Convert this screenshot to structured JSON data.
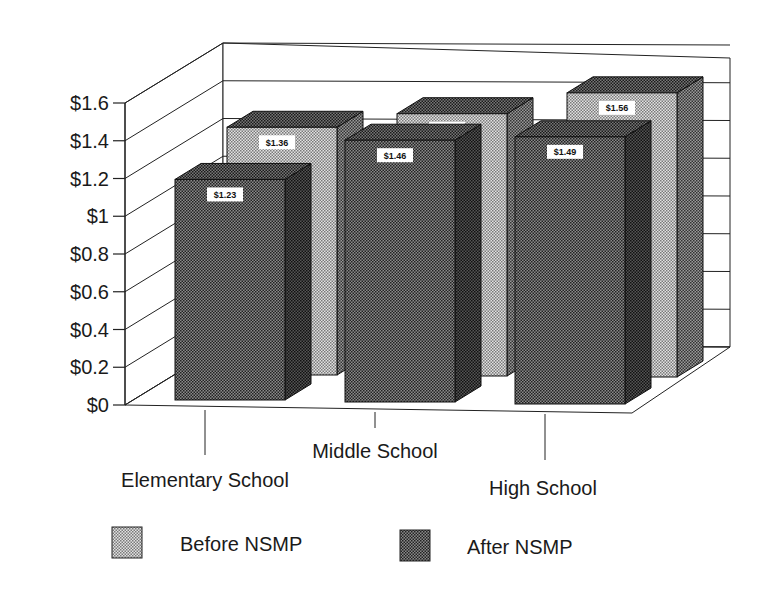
{
  "chart_data": {
    "type": "bar",
    "subtype": "3d-clustered-column",
    "title": "",
    "xlabel": "",
    "ylabel": "",
    "categories": [
      "Elementary School",
      "Middle School",
      "High School"
    ],
    "series": [
      {
        "name": "Before NSMP",
        "values": [
          1.36,
          1.44,
          1.56
        ],
        "labels": [
          "$1.36",
          "$1.44",
          "$1.56"
        ],
        "color": "#c8c8c8",
        "pattern": "light-dots"
      },
      {
        "name": "After NSMP",
        "values": [
          1.23,
          1.46,
          1.49
        ],
        "labels": [
          "$1.23",
          "$1.46",
          "$1.49"
        ],
        "color": "#555555",
        "pattern": "dark-dots"
      }
    ],
    "yticks": [
      "$0",
      "$0.2",
      "$0.4",
      "$0.6",
      "$0.8",
      "$1",
      "$1.2",
      "$1.4",
      "$1.6"
    ],
    "ylim": [
      0,
      1.6
    ],
    "grid": true,
    "legend_position": "bottom"
  },
  "legend": {
    "items": [
      {
        "label": "Before NSMP"
      },
      {
        "label": "After NSMP"
      }
    ]
  }
}
